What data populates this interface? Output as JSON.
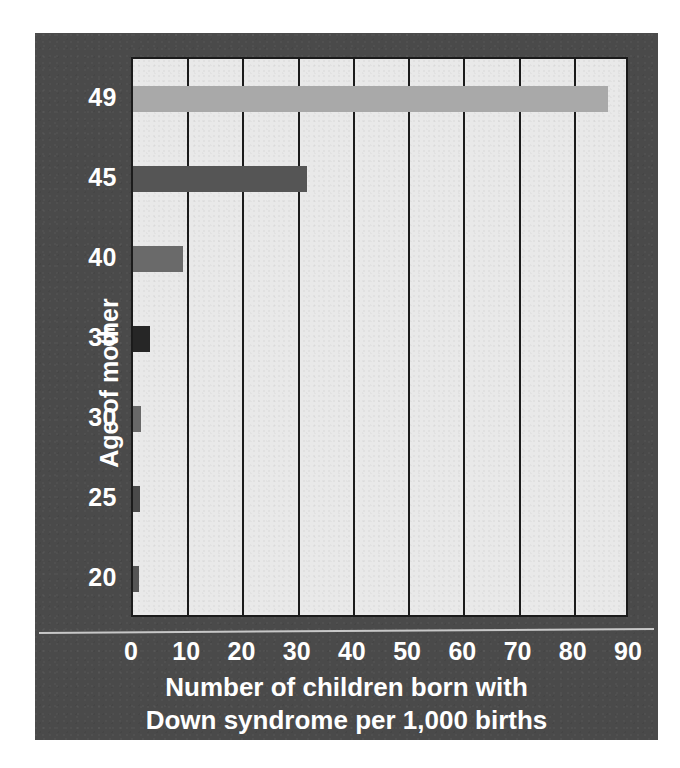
{
  "colors": {
    "page_background": "#ffffff",
    "panel_background": "#4a4a4a",
    "plot_background": "#e9e9e9",
    "axis_line": "#1b1b1b",
    "text": "#ffffff"
  },
  "axes": {
    "y_title": "Age of mother",
    "x_title_line1": "Number of children born with",
    "x_title_line2": "Down syndrome per 1,000 births"
  },
  "chart_data": {
    "type": "bar",
    "orientation": "horizontal",
    "title": "",
    "xlabel": "Number of children born with Down syndrome per 1,000 births",
    "ylabel": "Age of mother",
    "categories": [
      "20",
      "25",
      "30",
      "35",
      "40",
      "45",
      "49"
    ],
    "values": [
      1,
      1.2,
      1.5,
      3,
      9,
      31.5,
      86
    ],
    "bar_colors": [
      "#555555",
      "#4a4a4a",
      "#686868",
      "#262626",
      "#6a6a6a",
      "#555555",
      "#a9a9a9"
    ],
    "xlim": [
      0,
      90
    ],
    "xticks": [
      0,
      10,
      20,
      30,
      40,
      50,
      60,
      70,
      80,
      90
    ],
    "xtick_labels": [
      "0",
      "10",
      "20",
      "30",
      "40",
      "50",
      "60",
      "70",
      "80",
      "90"
    ],
    "ytick_labels": [
      "49",
      "45",
      "40",
      "35",
      "30",
      "25",
      "20"
    ],
    "grid": "vertical",
    "legend": "none"
  }
}
